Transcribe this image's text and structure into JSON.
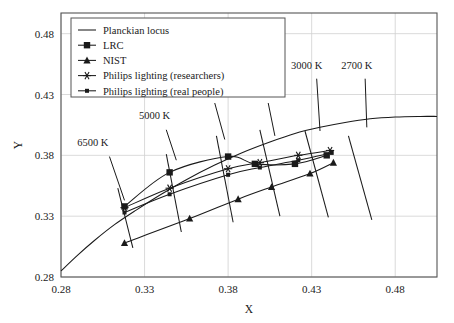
{
  "chart_data": {
    "type": "line",
    "title": "",
    "xlabel": "X",
    "ylabel": "Y",
    "xlim": [
      0.28,
      0.505
    ],
    "ylim": [
      0.28,
      0.497
    ],
    "xticks": [
      "0.28",
      "0.33",
      "0.38",
      "0.43",
      "0.48"
    ],
    "xtick_values": [
      0.28,
      0.33,
      0.38,
      0.43,
      0.48
    ],
    "yticks": [
      "0.28",
      "0.33",
      "0.38",
      "0.43",
      "0.48"
    ],
    "ytick_values": [
      0.28,
      0.33,
      0.38,
      0.43,
      0.48
    ],
    "grid": true,
    "legend_position": "top-left",
    "series": [
      {
        "name": "Planckian locus",
        "marker": "none",
        "x": [
          0.28,
          0.29,
          0.3,
          0.312,
          0.325,
          0.34,
          0.355,
          0.372,
          0.388,
          0.405,
          0.42,
          0.435,
          0.45,
          0.465,
          0.48,
          0.495,
          0.505
        ],
        "y": [
          0.285,
          0.298,
          0.31,
          0.323,
          0.335,
          0.348,
          0.36,
          0.372,
          0.382,
          0.391,
          0.398,
          0.403,
          0.407,
          0.41,
          0.4115,
          0.412,
          0.412
        ]
      },
      {
        "name": "LRC",
        "marker": "square",
        "x": [
          0.318,
          0.345,
          0.38,
          0.396,
          0.42,
          0.439
        ],
        "y": [
          0.338,
          0.366,
          0.379,
          0.373,
          0.373,
          0.38
        ]
      },
      {
        "name": "NIST",
        "marker": "triangle",
        "x": [
          0.318,
          0.357,
          0.386,
          0.406,
          0.429,
          0.443
        ],
        "y": [
          0.308,
          0.328,
          0.344,
          0.354,
          0.365,
          0.374
        ]
      },
      {
        "name": "Philips lighting (researchers)",
        "marker": "star",
        "x": [
          0.318,
          0.345,
          0.38,
          0.399,
          0.422,
          0.441
        ],
        "y": [
          0.337,
          0.353,
          0.369,
          0.374,
          0.38,
          0.384
        ]
      },
      {
        "name": "Philips lighting (real people)",
        "marker": "small-square",
        "x": [
          0.318,
          0.345,
          0.38,
          0.399,
          0.422,
          0.442
        ],
        "y": [
          0.333,
          0.348,
          0.364,
          0.37,
          0.376,
          0.382
        ]
      }
    ],
    "annotations": [
      {
        "label": "6500 K",
        "text_x": 0.299,
        "text_y": 0.388,
        "leader": {
          "x1": 0.309,
          "y1": 0.379,
          "x2": 0.318,
          "y2": 0.343
        }
      },
      {
        "label": "5000 K",
        "text_x": 0.336,
        "text_y": 0.41,
        "leader": {
          "x1": 0.343,
          "y1": 0.401,
          "x2": 0.349,
          "y2": 0.376
        }
      },
      {
        "label": "4100 K",
        "text_x": 0.364,
        "text_y": 0.432,
        "leader": {
          "x1": 0.372,
          "y1": 0.423,
          "x2": 0.378,
          "y2": 0.393
        }
      },
      {
        "label": "3500 K",
        "text_x": 0.397,
        "text_y": 0.432,
        "leader": {
          "x1": 0.404,
          "y1": 0.423,
          "x2": 0.408,
          "y2": 0.396
        }
      },
      {
        "label": "3000 K",
        "text_x": 0.427,
        "text_y": 0.451,
        "leader": {
          "x1": 0.433,
          "y1": 0.443,
          "x2": 0.435,
          "y2": 0.4
        }
      },
      {
        "label": "2700 K",
        "text_x": 0.457,
        "text_y": 0.451,
        "leader": {
          "x1": 0.462,
          "y1": 0.443,
          "x2": 0.463,
          "y2": 0.403
        }
      }
    ],
    "isotherms": [
      {
        "name": "isotherm-6500K",
        "x1": 0.314,
        "y1": 0.353,
        "x2": 0.323,
        "y2": 0.304
      },
      {
        "name": "isotherm-5000K",
        "x1": 0.343,
        "y1": 0.381,
        "x2": 0.352,
        "y2": 0.317
      },
      {
        "name": "isotherm-4100K",
        "x1": 0.373,
        "y1": 0.396,
        "x2": 0.383,
        "y2": 0.325
      },
      {
        "name": "isotherm-3500K",
        "x1": 0.399,
        "y1": 0.401,
        "x2": 0.411,
        "y2": 0.33
      },
      {
        "name": "isotherm-3000K",
        "x1": 0.426,
        "y1": 0.4,
        "x2": 0.44,
        "y2": 0.329
      },
      {
        "name": "isotherm-2700K",
        "x1": 0.452,
        "y1": 0.396,
        "x2": 0.466,
        "y2": 0.327
      }
    ],
    "colors": {
      "line": "#1a1a1a",
      "grid": "#d0d0d0",
      "frame": "#555555",
      "background": "#ffffff"
    }
  },
  "legend": {
    "items": [
      {
        "label": "Planckian locus",
        "marker": "none"
      },
      {
        "label": "LRC",
        "marker": "square"
      },
      {
        "label": "NIST",
        "marker": "triangle"
      },
      {
        "label": "Philips lighting (researchers)",
        "marker": "star"
      },
      {
        "label": "Philips lighting (real people)",
        "marker": "small-square"
      }
    ]
  }
}
